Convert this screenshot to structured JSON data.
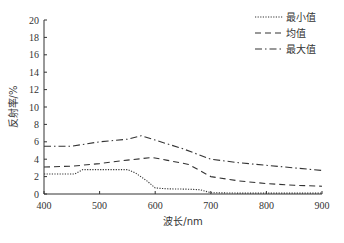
{
  "chart_data": {
    "type": "line",
    "title": "",
    "xlabel": "波长/nm",
    "ylabel": "反射率/%",
    "xlim": [
      400,
      900
    ],
    "ylim": [
      0,
      20
    ],
    "xticks": [
      400,
      500,
      600,
      700,
      800,
      900
    ],
    "yticks": [
      0,
      2,
      4,
      6,
      8,
      10,
      12,
      14,
      16,
      18,
      20
    ],
    "grid": false,
    "legend_position": "upper right",
    "series": [
      {
        "name": "最小值",
        "style": "dotted",
        "x": [
          400,
          455,
          470,
          550,
          565,
          585,
          600,
          620,
          660,
          680,
          700,
          750,
          800,
          850,
          900
        ],
        "values": [
          2.3,
          2.3,
          2.8,
          2.8,
          2.4,
          1.5,
          0.7,
          0.6,
          0.55,
          0.5,
          0.15,
          0.1,
          0.1,
          0.1,
          0.1
        ]
      },
      {
        "name": "均值",
        "style": "dashed",
        "x": [
          400,
          450,
          500,
          550,
          595,
          620,
          660,
          700,
          750,
          800,
          850,
          900
        ],
        "values": [
          3.1,
          3.2,
          3.5,
          3.9,
          4.2,
          3.9,
          3.4,
          2.0,
          1.5,
          1.2,
          1.0,
          0.9
        ]
      },
      {
        "name": "最大值",
        "style": "dashdot",
        "x": [
          400,
          450,
          500,
          550,
          575,
          600,
          650,
          700,
          750,
          800,
          850,
          900
        ],
        "values": [
          5.5,
          5.5,
          6.0,
          6.3,
          6.7,
          6.2,
          5.2,
          4.0,
          3.6,
          3.3,
          3.0,
          2.7
        ]
      }
    ]
  }
}
